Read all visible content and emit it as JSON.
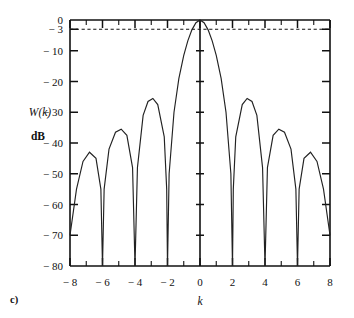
{
  "figure": {
    "panel_label": "c)",
    "ylabel_line1": "W(k)",
    "ylabel_line2": "dB",
    "xlabel": "k"
  },
  "chart_data": {
    "type": "line",
    "title": "",
    "subtitle": "",
    "xlabel": "k",
    "ylabel": "W(k) dB",
    "xlim": [
      -8,
      8
    ],
    "ylim": [
      -80,
      0
    ],
    "grid": false,
    "legend": null,
    "x_ticks_major": [
      -8,
      -6,
      -4,
      -2,
      0,
      2,
      4,
      6,
      8
    ],
    "x_tick_labels": [
      "− 8",
      "− 6",
      "− 4",
      "− 2",
      "0",
      "2",
      "4",
      "6",
      "8"
    ],
    "x_ticks_minor": [
      -7,
      -5,
      -3,
      -1,
      1,
      3,
      5,
      7
    ],
    "y_ticks_major": [
      0,
      -3,
      -10,
      -20,
      -30,
      -40,
      -50,
      -60,
      -70,
      -80
    ],
    "y_tick_labels": [
      "0",
      "− 3",
      "− 10",
      "− 20",
      "− 30",
      "− 40",
      "− 50",
      "− 60",
      "− 70",
      "− 80"
    ],
    "annotations": [
      {
        "type": "hline",
        "y": -3,
        "style": "dashed",
        "label": "− 3 dB half-power level"
      },
      {
        "type": "vline",
        "x": 0,
        "style": "solid",
        "label": "center axis at k = 0"
      }
    ],
    "series": [
      {
        "name": "W(k) magnitude response (dB)",
        "color": "#222222",
        "mainlobe_peak": {
          "x": 0,
          "y": 0
        },
        "nulls": [
          -8,
          -6,
          -4,
          -2,
          2,
          4,
          6,
          8
        ],
        "sidelobe_peaks": [
          {
            "x": -6.8,
            "y": -43.0
          },
          {
            "x": -4.85,
            "y": -35.5
          },
          {
            "x": -2.9,
            "y": -25.5
          },
          {
            "x": 2.9,
            "y": -25.5
          },
          {
            "x": 4.85,
            "y": -35.5
          },
          {
            "x": 6.8,
            "y": -43.0
          }
        ],
        "edge_values": [
          {
            "x": -8,
            "y": -70.0
          },
          {
            "x": 8,
            "y": -70.0
          }
        ],
        "sampled_points": [
          {
            "x": -8.0,
            "y": -70.0
          },
          {
            "x": -7.6,
            "y": -55.0
          },
          {
            "x": -7.2,
            "y": -46.0
          },
          {
            "x": -6.8,
            "y": -43.0
          },
          {
            "x": -6.4,
            "y": -45.0
          },
          {
            "x": -6.1,
            "y": -55.0
          },
          {
            "x": -6.0,
            "y": -80.0
          },
          {
            "x": -5.9,
            "y": -55.0
          },
          {
            "x": -5.6,
            "y": -42.0
          },
          {
            "x": -5.2,
            "y": -36.5
          },
          {
            "x": -4.85,
            "y": -35.5
          },
          {
            "x": -4.5,
            "y": -37.5
          },
          {
            "x": -4.15,
            "y": -48.0
          },
          {
            "x": -4.0,
            "y": -80.0
          },
          {
            "x": -3.85,
            "y": -48.0
          },
          {
            "x": -3.5,
            "y": -31.0
          },
          {
            "x": -3.2,
            "y": -26.5
          },
          {
            "x": -2.9,
            "y": -25.5
          },
          {
            "x": -2.6,
            "y": -27.5
          },
          {
            "x": -2.2,
            "y": -38.0
          },
          {
            "x": -2.05,
            "y": -55.0
          },
          {
            "x": -2.0,
            "y": -80.0
          },
          {
            "x": -1.9,
            "y": -50.0
          },
          {
            "x": -1.6,
            "y": -30.0
          },
          {
            "x": -1.3,
            "y": -19.0
          },
          {
            "x": -1.0,
            "y": -11.5
          },
          {
            "x": -0.75,
            "y": -6.8
          },
          {
            "x": -0.5,
            "y": -3.2
          },
          {
            "x": -0.25,
            "y": -0.9
          },
          {
            "x": 0.0,
            "y": 0.0
          },
          {
            "x": 0.25,
            "y": -0.9
          },
          {
            "x": 0.5,
            "y": -3.2
          },
          {
            "x": 0.75,
            "y": -6.8
          },
          {
            "x": 1.0,
            "y": -11.5
          },
          {
            "x": 1.3,
            "y": -19.0
          },
          {
            "x": 1.6,
            "y": -30.0
          },
          {
            "x": 1.9,
            "y": -50.0
          },
          {
            "x": 2.0,
            "y": -80.0
          },
          {
            "x": 2.05,
            "y": -55.0
          },
          {
            "x": 2.2,
            "y": -38.0
          },
          {
            "x": 2.6,
            "y": -27.5
          },
          {
            "x": 2.9,
            "y": -25.5
          },
          {
            "x": 3.2,
            "y": -26.5
          },
          {
            "x": 3.5,
            "y": -31.0
          },
          {
            "x": 3.85,
            "y": -48.0
          },
          {
            "x": 4.0,
            "y": -80.0
          },
          {
            "x": 4.15,
            "y": -48.0
          },
          {
            "x": 4.5,
            "y": -37.5
          },
          {
            "x": 4.85,
            "y": -35.5
          },
          {
            "x": 5.2,
            "y": -36.5
          },
          {
            "x": 5.6,
            "y": -42.0
          },
          {
            "x": 5.9,
            "y": -55.0
          },
          {
            "x": 6.0,
            "y": -80.0
          },
          {
            "x": 6.1,
            "y": -55.0
          },
          {
            "x": 6.4,
            "y": -45.0
          },
          {
            "x": 6.8,
            "y": -43.0
          },
          {
            "x": 7.2,
            "y": -46.0
          },
          {
            "x": 7.6,
            "y": -55.0
          },
          {
            "x": 8.0,
            "y": -70.0
          }
        ]
      }
    ]
  }
}
